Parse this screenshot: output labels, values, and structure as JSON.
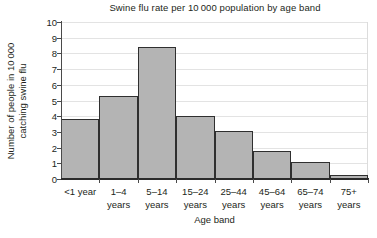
{
  "chart_data": {
    "type": "bar",
    "title": "Swine flu rate per 10 000 population by age band",
    "xlabel": "Age band",
    "ylabel_line1": "Number of people in 10 000",
    "ylabel_line2": "catching swine flu",
    "categories": [
      "<1 year",
      "1–4 years",
      "5–14 years",
      "15–24 years",
      "25–44 years",
      "45–64 years",
      "65–74 years",
      "75+ years"
    ],
    "category_lines": [
      {
        "l1": "<1 year",
        "l2": ""
      },
      {
        "l1": "1–4",
        "l2": "years"
      },
      {
        "l1": "5–14",
        "l2": "years"
      },
      {
        "l1": "15–24",
        "l2": "years"
      },
      {
        "l1": "25–44",
        "l2": "years"
      },
      {
        "l1": "45–64",
        "l2": "years"
      },
      {
        "l1": "65–74",
        "l2": "years"
      },
      {
        "l1": "75+",
        "l2": "years"
      }
    ],
    "values": [
      3.85,
      5.3,
      8.4,
      4.0,
      3.05,
      1.8,
      1.1,
      0.25
    ],
    "ylim": [
      0,
      10
    ],
    "ytick_labels": [
      "0",
      "1",
      "2",
      "3",
      "4",
      "5",
      "6",
      "7",
      "8",
      "9",
      "10"
    ],
    "ytick_values": [
      0,
      1,
      2,
      3,
      4,
      5,
      6,
      7,
      8,
      9,
      10
    ],
    "grid": true,
    "legend": "none",
    "bar_fill_color": "#b4b4b4",
    "bar_border_color": "#2f2f2f",
    "gridline_color": "#e3e3e3",
    "axis_color": "#2b2b2b",
    "background_color": "#ffffff"
  }
}
